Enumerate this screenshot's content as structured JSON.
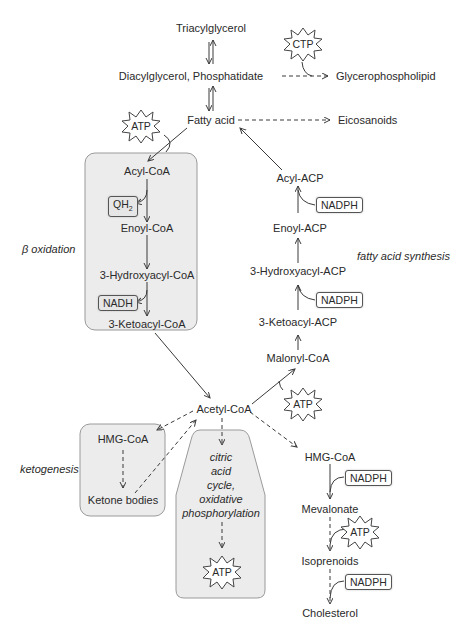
{
  "nodes": {
    "triacylglycerol": "Triacylglycerol",
    "diacylglycerol": "Diacylglycerol, Phosphatidate",
    "glycerophospholipid": "Glycerophospholipid",
    "fatty_acid": "Fatty acid",
    "eicosanoids": "Eicosanoids",
    "acyl_coa": "Acyl-CoA",
    "enoyl_coa": "Enoyl-CoA",
    "hydroxyacyl_coa": "3-Hydroxyacyl-CoA",
    "ketoacyl_coa": "3-Ketoacyl-CoA",
    "acyl_acp": "Acyl-ACP",
    "enoyl_acp": "Enoyl-ACP",
    "hydroxyacyl_acp": "3-Hydroxyacyl-ACP",
    "ketoacyl_acp": "3-Ketoacyl-ACP",
    "malonyl_coa": "Malonyl-CoA",
    "acetyl_coa": "Acetyl-CoA",
    "hmg_coa_keto": "HMG-CoA",
    "ketone_bodies": "Ketone bodies",
    "hmg_coa": "HMG-CoA",
    "mevalonate": "Mevalonate",
    "isoprenoids": "Isoprenoids",
    "cholesterol": "Cholesterol"
  },
  "pathways": {
    "beta_oxidation": "β oxidation",
    "fatty_acid_synthesis": "fatty acid synthesis",
    "ketogenesis": "ketogenesis",
    "tca_lines": [
      "citric",
      "acid",
      "cycle,",
      "oxidative",
      "phosphorylation"
    ]
  },
  "cofactors": {
    "ctp": "CTP",
    "atp_fa": "ATP",
    "qh2": "QH2",
    "nadh": "NADH",
    "nadph_1": "NADPH",
    "nadph_2": "NADPH",
    "atp_malonyl": "ATP",
    "atp_tca": "ATP",
    "nadph_3": "NADPH",
    "atp_iso": "ATP",
    "nadph_4": "NADPH"
  },
  "colors": {
    "box_fill": "#ececec",
    "box_stroke": "#9a9a9a",
    "line": "#3a3a3a"
  }
}
